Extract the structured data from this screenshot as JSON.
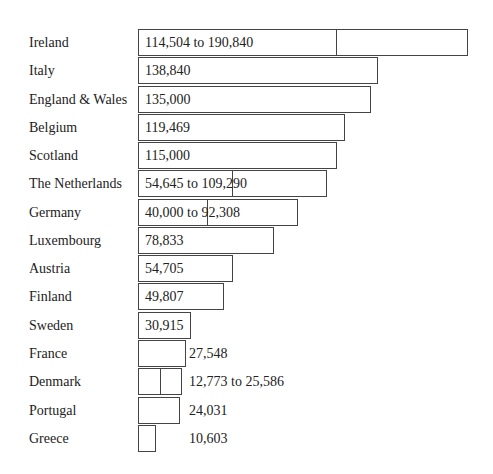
{
  "chart_data": {
    "type": "bar",
    "orientation": "horizontal",
    "title": "",
    "xlabel": "",
    "ylabel": "",
    "grid": false,
    "legend": null,
    "categories": [
      "Ireland",
      "Italy",
      "England & Wales",
      "Belgium",
      "Scotland",
      "The Netherlands",
      "Germany",
      "Luxembourg",
      "Austria",
      "Finland",
      "Sweden",
      "France",
      "Denmark",
      "Portugal",
      "Greece"
    ],
    "labels": [
      "114,504 to 190,840",
      "138,840",
      "135,000",
      "119,469",
      "115,000",
      "54,645 to 109,290",
      "40,000 to 92,308",
      "78,833",
      "54,705",
      "49,807",
      "30,915",
      "27,548",
      "12,773 to 25,586",
      "24,031",
      "10,603"
    ],
    "values_low": [
      114504,
      138840,
      135000,
      119469,
      115000,
      54645,
      40000,
      78833,
      54705,
      49807,
      30915,
      27548,
      12773,
      24031,
      10603
    ],
    "values_high": [
      190840,
      138840,
      135000,
      119469,
      115000,
      109290,
      92308,
      78833,
      54705,
      49807,
      30915,
      27548,
      25586,
      24031,
      10603
    ],
    "is_range": [
      true,
      false,
      false,
      false,
      false,
      true,
      true,
      false,
      false,
      false,
      false,
      false,
      true,
      false,
      false
    ],
    "label_inside": [
      true,
      true,
      true,
      true,
      true,
      true,
      true,
      true,
      true,
      true,
      true,
      false,
      false,
      false,
      false
    ]
  },
  "layout": {
    "bar_left": 138,
    "top": 29,
    "row_h": 28.27,
    "scale_px_per_unit": 0.0017289
  }
}
